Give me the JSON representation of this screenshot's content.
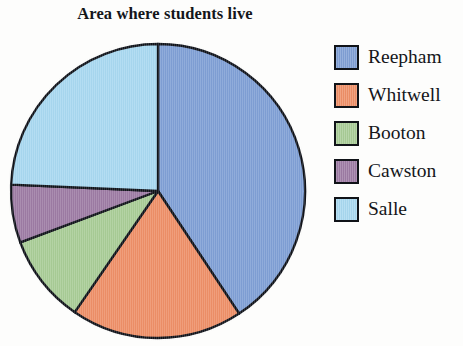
{
  "chart_data": {
    "type": "pie",
    "title": "Area where students live",
    "categories": [
      "Reepham",
      "Whitwell",
      "Booton",
      "Cawston",
      "Salle"
    ],
    "values": [
      40.7,
      18.9,
      9.7,
      6.4,
      24.3
    ],
    "units": "percent",
    "start_angle_deg": 0,
    "direction": "clockwise",
    "slice_angles_deg": [
      146.5,
      68.0,
      35.0,
      23.0,
      87.5
    ],
    "colors": [
      "#7f9fd5",
      "#ee8f67",
      "#a8cc96",
      "#9d7ba4",
      "#a8d8f0"
    ],
    "legend_position": "right",
    "grid": false,
    "xlabel": "",
    "ylabel": "",
    "slices": [
      {
        "label": "Reepham",
        "value": 40.7,
        "angle_deg": 146.5,
        "color": "#7f9fd5"
      },
      {
        "label": "Whitwell",
        "value": 18.9,
        "angle_deg": 68.0,
        "color": "#ee8f67"
      },
      {
        "label": "Booton",
        "value": 9.7,
        "angle_deg": 35.0,
        "color": "#a8cc96"
      },
      {
        "label": "Cawston",
        "value": 6.4,
        "angle_deg": 23.0,
        "color": "#9d7ba4"
      },
      {
        "label": "Salle",
        "value": 24.3,
        "angle_deg": 87.5,
        "color": "#a8d8f0"
      }
    ]
  },
  "title": {
    "text": "Area where students live"
  },
  "legend": {
    "items": [
      {
        "label": "Reepham",
        "color": "#7f9fd5"
      },
      {
        "label": "Whitwell",
        "color": "#ee8f67"
      },
      {
        "label": "Booton",
        "color": "#a8cc96"
      },
      {
        "label": "Cawston",
        "color": "#9d7ba4"
      },
      {
        "label": "Salle",
        "color": "#a8d8f0"
      }
    ]
  }
}
